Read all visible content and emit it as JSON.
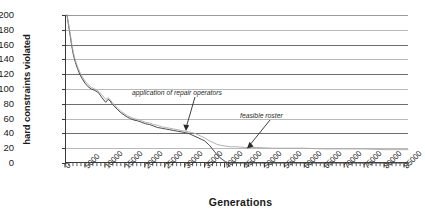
{
  "chart_data": {
    "type": "line",
    "title": "",
    "xlabel": "Generations",
    "ylabel": "hard constraints violated",
    "xlim": [
      0,
      86000
    ],
    "ylim": [
      0,
      200
    ],
    "grid": true,
    "legend": "none",
    "xticks": [
      0,
      5000,
      10000,
      15000,
      20000,
      25000,
      30000,
      35000,
      40000,
      45000,
      50000,
      55000,
      60000,
      65000,
      70000,
      75000,
      80000,
      85000
    ],
    "xtick_labels": [
      "0",
      "5000",
      "10000",
      "15000",
      "20000",
      "25000",
      "30000",
      "35000",
      "40000",
      "45000",
      "50000",
      "55000",
      "60000",
      "65000",
      "70000",
      "75000",
      "80000",
      "85000"
    ],
    "yticks": [
      0,
      20,
      40,
      60,
      80,
      100,
      120,
      140,
      160,
      180,
      200
    ],
    "ytick_labels": [
      "0",
      "20",
      "40",
      "60",
      "80",
      "100",
      "120",
      "140",
      "160",
      "180",
      "200"
    ],
    "minor_xtick_step": 1000,
    "series": [
      {
        "name": "best solution",
        "color": "#4a4a4a",
        "x": [
          500,
          900,
          1300,
          1700,
          2100,
          2600,
          3100,
          3700,
          4300,
          5000,
          5800,
          6600,
          7500,
          8400,
          9300,
          10200,
          10800,
          11300,
          11800,
          12500,
          13200,
          14000,
          14800,
          15600,
          16400,
          17300,
          18200,
          19200,
          20200,
          21200,
          22200,
          23200,
          24200,
          25200,
          26200,
          27200,
          28200,
          29200,
          30200,
          31000,
          31800,
          32600,
          33400,
          34200,
          35000,
          35600,
          36200,
          36800,
          37400,
          38000,
          38700,
          39400,
          40200,
          41000,
          42000,
          43500,
          45000,
          50000,
          60000,
          70000,
          80000,
          86000
        ],
        "y": [
          200,
          186,
          172,
          158,
          146,
          136,
          128,
          120,
          114,
          108,
          103,
          100,
          98,
          95,
          88,
          82,
          86,
          84,
          80,
          76,
          72,
          68,
          65,
          62,
          60,
          58,
          57,
          55,
          53,
          52,
          50,
          48,
          47,
          46,
          45,
          44,
          43,
          42,
          41,
          40,
          38,
          36,
          34,
          32,
          30,
          27,
          24,
          20,
          16,
          12,
          8,
          5,
          2,
          0,
          0,
          0,
          0,
          0,
          0,
          0,
          0,
          0
        ]
      },
      {
        "name": "population average",
        "color": "#a8a8a8",
        "x": [
          500,
          900,
          1300,
          1700,
          2100,
          2600,
          3100,
          3700,
          4300,
          5000,
          5800,
          6600,
          7500,
          8400,
          9300,
          10200,
          10800,
          11300,
          11800,
          12500,
          13200,
          14000,
          14800,
          15600,
          16400,
          17300,
          18200,
          19200,
          20200,
          21200,
          22200,
          23200,
          24200,
          25200,
          26200,
          27200,
          28200,
          29200,
          30200,
          31000,
          31800,
          32600,
          33400,
          34200,
          35000,
          35800,
          36600,
          37400,
          38200,
          39000,
          40000,
          41500,
          43000,
          45000,
          48000,
          52000,
          56000,
          60000,
          65000,
          70000,
          75000,
          80000,
          86000
        ],
        "y": [
          200,
          188,
          175,
          161,
          149,
          139,
          131,
          123,
          117,
          111,
          106,
          102,
          100,
          97,
          92,
          86,
          88,
          86,
          82,
          78,
          74,
          70,
          67,
          64,
          62,
          60,
          59,
          57,
          55,
          54,
          52,
          51,
          49,
          48,
          47,
          46,
          45,
          44,
          43,
          42,
          41,
          40,
          38,
          36,
          34,
          31,
          29,
          27,
          25,
          24,
          23,
          22,
          22,
          21,
          21,
          20,
          20,
          20,
          19,
          19,
          19,
          18,
          18
        ]
      }
    ],
    "annotations": [
      {
        "id": "application-of-repair-operators",
        "text": "application of repair operators",
        "points_to_x": 35000,
        "points_to_y": 40
      },
      {
        "id": "feasible-roster",
        "text": "feasible roster",
        "points_to_x": 47000,
        "points_to_y": 8
      }
    ]
  }
}
